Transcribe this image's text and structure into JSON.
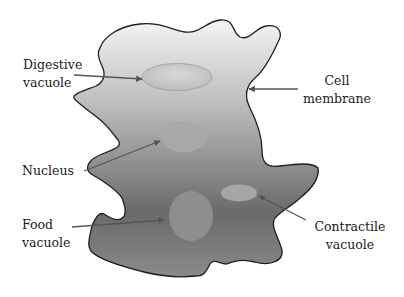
{
  "diagram": {
    "colors": {
      "outline": "#1e1e1e",
      "body_top": "#f2f2f2",
      "body_bottom": "#4a4a4a",
      "organelle": "#a8a8a8",
      "arrow": "#555555",
      "text": "#1a1a1a"
    },
    "labels": [
      {
        "id": "digestive-vacuole",
        "lines": [
          "Digestive",
          "vacuole"
        ]
      },
      {
        "id": "cell-membrane",
        "lines": [
          "Cell",
          "membrane"
        ]
      },
      {
        "id": "nucleus",
        "lines": [
          "Nucleus"
        ]
      },
      {
        "id": "food-vacuole",
        "lines": [
          "Food",
          "vacuole"
        ]
      },
      {
        "id": "contractile-vacuole",
        "lines": [
          "Contractile",
          "vacuole"
        ]
      }
    ]
  }
}
